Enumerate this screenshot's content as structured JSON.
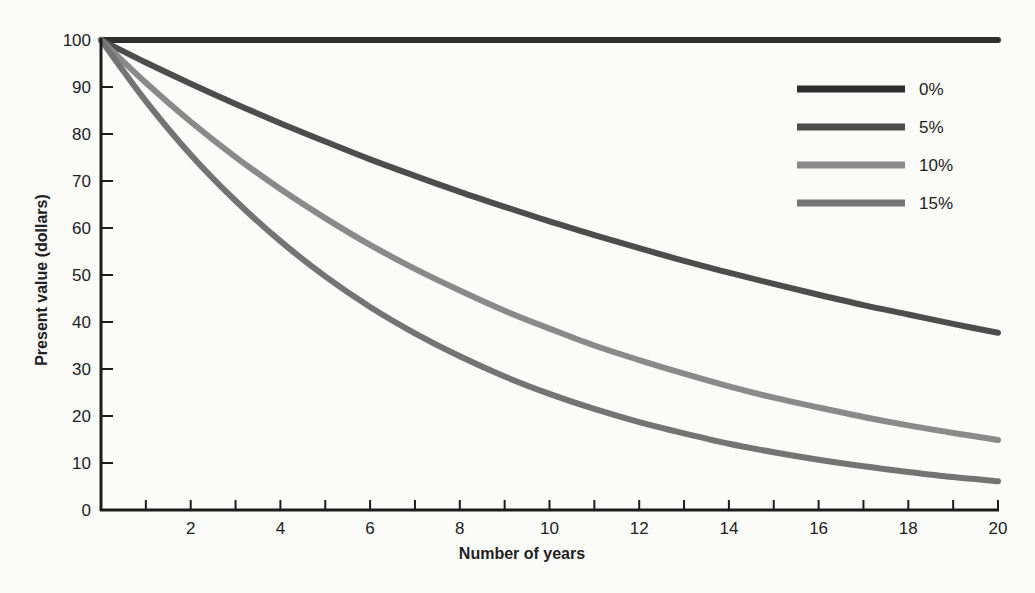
{
  "chart_data": {
    "type": "line",
    "title": "",
    "xlabel": "Number of years",
    "ylabel": "Present value (dollars)",
    "xlim": [
      0,
      20
    ],
    "ylim": [
      0,
      100
    ],
    "x_ticks": [
      2,
      4,
      6,
      8,
      10,
      12,
      14,
      16,
      18,
      20
    ],
    "x_minor_ticks": [
      1,
      3,
      5,
      7,
      9,
      11,
      13,
      15,
      17,
      19
    ],
    "y_ticks": [
      0,
      10,
      20,
      30,
      40,
      50,
      60,
      70,
      80,
      90,
      100
    ],
    "grid": false,
    "legend_position": "upper right",
    "x": [
      0,
      1,
      2,
      3,
      4,
      5,
      6,
      7,
      8,
      9,
      10,
      11,
      12,
      13,
      14,
      15,
      16,
      17,
      18,
      19,
      20
    ],
    "series": [
      {
        "name": "0%",
        "color": "#2e2e2e",
        "values": [
          100,
          100,
          100,
          100,
          100,
          100,
          100,
          100,
          100,
          100,
          100,
          100,
          100,
          100,
          100,
          100,
          100,
          100,
          100,
          100,
          100
        ]
      },
      {
        "name": "5%",
        "color": "#4d4d4d",
        "values": [
          100,
          95.2,
          90.7,
          86.4,
          82.3,
          78.4,
          74.6,
          71.1,
          67.7,
          64.5,
          61.4,
          58.5,
          55.7,
          53.0,
          50.5,
          48.1,
          45.8,
          43.6,
          41.6,
          39.6,
          37.7
        ]
      },
      {
        "name": "10%",
        "color": "#8a8a8a",
        "values": [
          100,
          90.9,
          82.6,
          75.1,
          68.3,
          62.1,
          56.4,
          51.3,
          46.7,
          42.4,
          38.6,
          35.0,
          31.9,
          29.0,
          26.3,
          23.9,
          21.8,
          19.8,
          18.0,
          16.4,
          14.9
        ]
      },
      {
        "name": "15%",
        "color": "#747474",
        "values": [
          100,
          87.0,
          75.6,
          65.8,
          57.2,
          49.7,
          43.2,
          37.6,
          32.7,
          28.4,
          24.7,
          21.5,
          18.7,
          16.3,
          14.1,
          12.3,
          10.7,
          9.3,
          8.1,
          7.0,
          6.1
        ]
      }
    ]
  }
}
